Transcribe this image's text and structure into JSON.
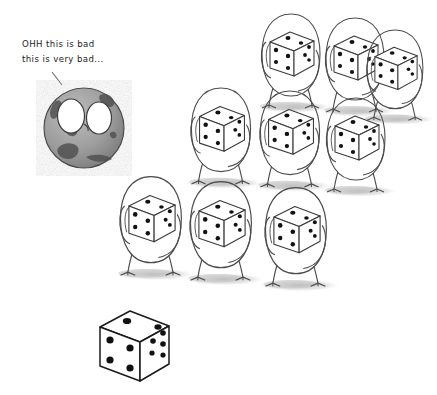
{
  "scene": {
    "title": "hand-drawn sketch of worried Earth and dice-holding creatures",
    "background_color": "#ffffff",
    "ink_color": "#2b2b2b",
    "shadow_color": "#c9c9c9",
    "pip_color": "#111111"
  },
  "caption": {
    "line1": "OHH this is bad",
    "line2": "this is very bad...",
    "pointer_label": "pointer-line-to-earth"
  },
  "earth": {
    "label": "worried-earth-character",
    "center_x": 84,
    "center_y": 128,
    "radius": 40,
    "surface_color": "#9a9a9a",
    "land_color": "#4a4a4a",
    "eye_color": "#ffffff",
    "eyes": 2
  },
  "creatures": {
    "label": "dice-holding-creature",
    "count": 9,
    "rows": [
      {
        "row_name": "top-row",
        "items": [
          {
            "name": "creature-1",
            "x": 292,
            "y": 62,
            "scale": 1.0
          },
          {
            "name": "creature-2",
            "x": 356,
            "y": 66,
            "scale": 1.0
          },
          {
            "name": "creature-3",
            "x": 396,
            "y": 76,
            "scale": 0.96
          }
        ]
      },
      {
        "row_name": "middle-row",
        "items": [
          {
            "name": "creature-4",
            "x": 222,
            "y": 137,
            "scale": 1.02
          },
          {
            "name": "creature-5",
            "x": 291,
            "y": 140,
            "scale": 1.02
          },
          {
            "name": "creature-6",
            "x": 357,
            "y": 146,
            "scale": 1.0
          }
        ]
      },
      {
        "row_name": "bottom-row",
        "items": [
          {
            "name": "creature-7",
            "x": 152,
            "y": 227,
            "scale": 1.05
          },
          {
            "name": "creature-8",
            "x": 222,
            "y": 232,
            "scale": 1.05
          },
          {
            "name": "creature-9",
            "x": 297,
            "y": 238,
            "scale": 1.05
          }
        ]
      }
    ],
    "held_die": {
      "label": "held-die",
      "top_face_pips": 2,
      "left_face_pips": 4,
      "right_face_pips": 3
    }
  },
  "big_die": {
    "label": "large-foreground-die",
    "x": 136,
    "y": 345,
    "size": 38,
    "top_face_pips": 2,
    "left_face_pips": 4,
    "right_face_pips": 5,
    "face_color": "#ffffff",
    "pip_color": "#111111"
  }
}
